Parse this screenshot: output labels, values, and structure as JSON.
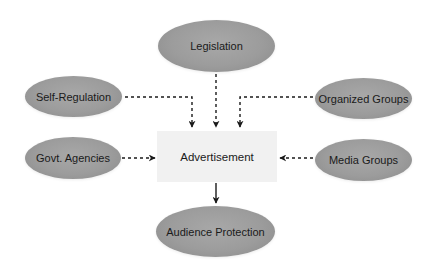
{
  "diagram": {
    "center": {
      "label": "Advertisement"
    },
    "nodes": {
      "legislation": {
        "label": "Legislation"
      },
      "self_regulation": {
        "label": "Self-Regulation"
      },
      "organized_groups": {
        "label": "Organized Groups"
      },
      "govt_agencies": {
        "label": "Govt. Agencies"
      },
      "media_groups": {
        "label": "Media Groups"
      },
      "audience_protection": {
        "label": "Audience Protection"
      }
    },
    "edges": [
      {
        "from": "Legislation",
        "to": "Advertisement",
        "style": "dashed"
      },
      {
        "from": "Self-Regulation",
        "to": "Advertisement",
        "style": "dashed"
      },
      {
        "from": "Organized Groups",
        "to": "Advertisement",
        "style": "dashed"
      },
      {
        "from": "Govt. Agencies",
        "to": "Advertisement",
        "style": "dashed"
      },
      {
        "from": "Media Groups",
        "to": "Advertisement",
        "style": "dashed"
      },
      {
        "from": "Advertisement",
        "to": "Audience Protection",
        "style": "solid"
      }
    ],
    "colors": {
      "ellipse_fill": "#9c9c9c",
      "box_fill": "#f1f1f1",
      "line": "#1a1a1a",
      "text": "#1a1a1a"
    }
  }
}
